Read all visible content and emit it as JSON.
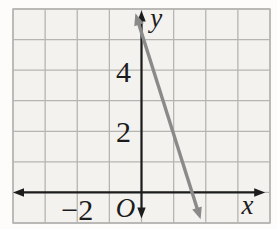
{
  "figure": {
    "origin_label": "O"
  },
  "chart_data": {
    "type": "line",
    "title": "",
    "xlabel": "x",
    "ylabel": "y",
    "xlim": [
      -4,
      4
    ],
    "ylim": [
      -1,
      6
    ],
    "grid": true,
    "x_tick_labels": [
      {
        "value": -2,
        "label": "−2"
      }
    ],
    "y_tick_labels": [
      {
        "value": 2,
        "label": "2"
      },
      {
        "value": 4,
        "label": "4"
      }
    ],
    "axes": {
      "x_axis": {
        "from": -4.0,
        "to": 3.85,
        "arrows": "both"
      },
      "y_axis": {
        "from": -0.85,
        "to": 5.95,
        "arrows": "both"
      },
      "color": "#1c1c1c",
      "stroke_width": 2.2
    },
    "series": [
      {
        "name": "plotted-line",
        "equation": "y = -3x + 5",
        "slope": -3,
        "y_intercept": 5,
        "x_intercept": 1.67,
        "draw_from": [
          -0.19,
          5.86
        ],
        "draw_to": [
          1.84,
          -0.88
        ],
        "color": "#8a8a8a",
        "stroke_width": 3.4,
        "arrows": "both"
      }
    ],
    "labels": [
      {
        "name": "y-axis-label",
        "text": "y",
        "x": 0.46,
        "y": 5.72,
        "style": "italic"
      },
      {
        "name": "x-axis-label",
        "text": "x",
        "x": 3.3,
        "y": -0.38,
        "style": "italic"
      },
      {
        "name": "origin-label",
        "text": "O",
        "x": -0.5,
        "y": -0.5,
        "style": "italic"
      },
      {
        "name": "y-tick-label-4",
        "text": "4",
        "x": -0.56,
        "y": 3.96,
        "style": "normal"
      },
      {
        "name": "y-tick-label-2",
        "text": "2",
        "x": -0.56,
        "y": 2.0,
        "style": "normal"
      },
      {
        "name": "x-tick-label-neg2",
        "text": "−2",
        "x": -2.0,
        "y": -0.56,
        "style": "normal"
      }
    ],
    "colors": {
      "background": "#fdfcfa",
      "plot_background": "#f3f2ef",
      "grid": "#b6b5b2",
      "axis": "#1c1c1c",
      "text": "#1c1c1c"
    }
  }
}
